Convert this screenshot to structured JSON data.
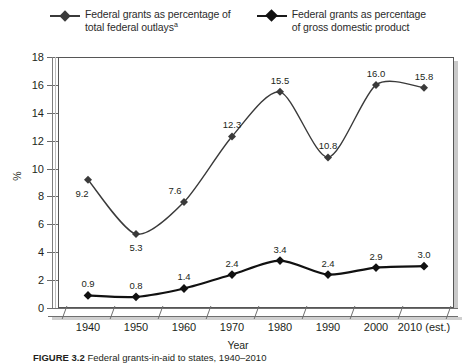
{
  "legend": {
    "entries": [
      {
        "label": "Federal grants as percentage of\ntotal federal outlays",
        "superscript": "a",
        "marker": "diamond-line-marker",
        "color": "#3a3a3a"
      },
      {
        "label": "Federal grants as percentage\nof gross domestic product",
        "superscript": "",
        "marker": "diamond-line-marker",
        "color": "#111111"
      }
    ]
  },
  "caption": {
    "figure_number": "FIGURE 3.2",
    "text": "Federal grants-in-aid to states, 1940–2010"
  },
  "chart_data": {
    "type": "line",
    "title": "",
    "xlabel": "Year",
    "ylabel": "%",
    "categories": [
      "1940",
      "1950",
      "1960",
      "1970",
      "1980",
      "1990",
      "2000",
      "2010 (est.)"
    ],
    "ylim": [
      0,
      18
    ],
    "yticks": [
      0,
      2,
      4,
      6,
      8,
      10,
      12,
      14,
      16,
      18
    ],
    "grid": false,
    "legend_position": "top",
    "series": [
      {
        "name": "Federal grants as percentage of total federal outlays",
        "values": [
          9.2,
          5.3,
          7.6,
          12.3,
          15.5,
          10.8,
          16.0,
          15.8
        ],
        "labels": [
          "9.2",
          "5.3",
          "7.6",
          "12.3",
          "15.5",
          "10.8",
          "16.0",
          "15.8"
        ],
        "color": "#3a3a3a",
        "line_width": 1.4
      },
      {
        "name": "Federal grants as percentage of gross domestic product",
        "values": [
          0.9,
          0.8,
          1.4,
          2.4,
          3.4,
          2.4,
          2.9,
          3.0
        ],
        "labels": [
          "0.9",
          "0.8",
          "1.4",
          "2.4",
          "3.4",
          "2.4",
          "2.9",
          "3.0"
        ],
        "color": "#111111",
        "line_width": 2.2
      }
    ]
  }
}
